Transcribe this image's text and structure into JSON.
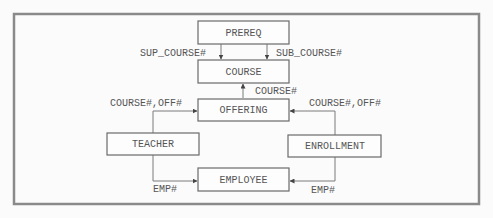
{
  "diagram": {
    "entities": {
      "prereq": "PREREQ",
      "course": "COURSE",
      "offering": "OFFERING",
      "teacher": "TEACHER",
      "enrollment": "ENROLLMENT",
      "employee": "EMPLOYEE"
    },
    "relationships": [
      {
        "from": "PREREQ",
        "to": "COURSE",
        "label": "SUP_COURSE#"
      },
      {
        "from": "PREREQ",
        "to": "COURSE",
        "label": "SUB_COURSE#"
      },
      {
        "from": "OFFERING",
        "to": "COURSE",
        "label": "COURSE#"
      },
      {
        "from": "TEACHER",
        "to": "OFFERING",
        "label": "COURSE#,OFF#"
      },
      {
        "from": "ENROLLMENT",
        "to": "OFFERING",
        "label": "COURSE#,OFF#"
      },
      {
        "from": "TEACHER",
        "to": "EMPLOYEE",
        "label": "EMP#"
      },
      {
        "from": "ENROLLMENT",
        "to": "EMPLOYEE",
        "label": "EMP#"
      }
    ]
  }
}
